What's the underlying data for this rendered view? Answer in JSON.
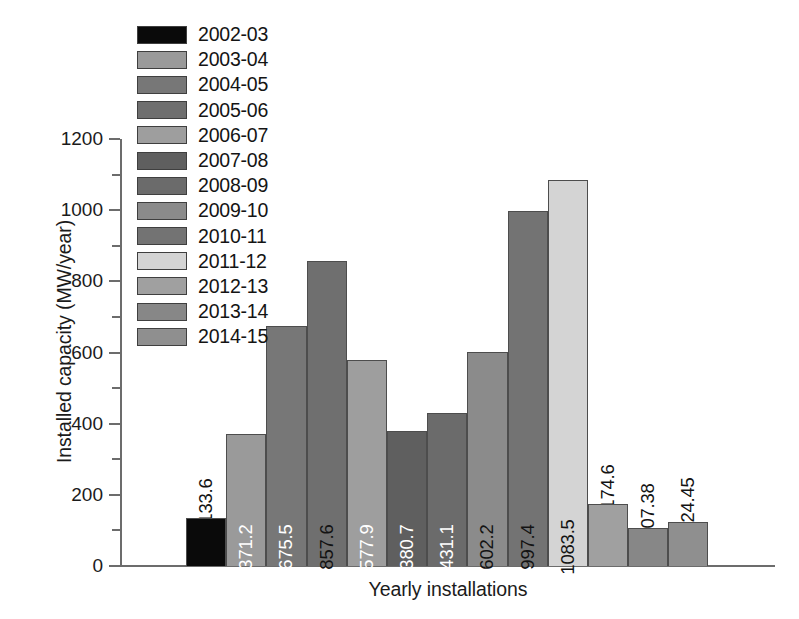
{
  "chart_data": {
    "type": "bar",
    "title": "",
    "xlabel": "Yearly installations",
    "ylabel": "Installed capacity (MW/year)",
    "ylim": [
      0,
      1200
    ],
    "ytick_labels": [
      "0",
      "200",
      "400",
      "600",
      "800",
      "1000",
      "1200"
    ],
    "ytick_values": [
      0,
      200,
      400,
      600,
      800,
      1000,
      1200
    ],
    "minor_tick_interval": 100,
    "grid": false,
    "legend_position": "top-left",
    "categories": [
      "2002-03",
      "2003-04",
      "2004-05",
      "2005-06",
      "2006-07",
      "2007-08",
      "2008-09",
      "2009-10",
      "2010-11",
      "2011-12",
      "2012-13",
      "2013-14",
      "2014-15"
    ],
    "values": [
      133.6,
      371.2,
      675.5,
      857.6,
      577.9,
      380.7,
      431.1,
      602.2,
      997.4,
      1083.5,
      174.6,
      107.38,
      124.45
    ],
    "value_labels": [
      "133.6",
      "371.2",
      "675.5",
      "857.6",
      "577.9",
      "380.7",
      "431.1",
      "602.2",
      "997.4",
      "1083.5",
      "174.6",
      "107.38",
      "124.45"
    ],
    "bar_colors": [
      "#0a0a0a",
      "#9a9a9a",
      "#777777",
      "#6f6f6f",
      "#9e9e9e",
      "#5f5f5f",
      "#6b6b6b",
      "#8b8b8b",
      "#737373",
      "#d4d4d4",
      "#a0a0a0",
      "#878787",
      "#8f8f8f"
    ],
    "label_text_colors": [
      "black",
      "white",
      "white",
      "black",
      "white",
      "white",
      "white",
      "black",
      "black",
      "black",
      "black",
      "black",
      "black"
    ],
    "label_placement": [
      "outside",
      "inside",
      "inside",
      "inside",
      "inside",
      "inside",
      "inside",
      "inside",
      "inside",
      "inside",
      "outside",
      "outside",
      "outside"
    ]
  },
  "legend": {
    "items": [
      {
        "label": "2002-03",
        "color": "#0a0a0a"
      },
      {
        "label": "2003-04",
        "color": "#9a9a9a"
      },
      {
        "label": "2004-05",
        "color": "#777777"
      },
      {
        "label": "2005-06",
        "color": "#6f6f6f"
      },
      {
        "label": "2006-07",
        "color": "#9e9e9e"
      },
      {
        "label": "2007-08",
        "color": "#5f5f5f"
      },
      {
        "label": "2008-09",
        "color": "#6b6b6b"
      },
      {
        "label": "2009-10",
        "color": "#8b8b8b"
      },
      {
        "label": "2010-11",
        "color": "#737373"
      },
      {
        "label": "2011-12",
        "color": "#d4d4d4"
      },
      {
        "label": "2012-13",
        "color": "#a0a0a0"
      },
      {
        "label": "2013-14",
        "color": "#878787"
      },
      {
        "label": "2014-15",
        "color": "#8f8f8f"
      }
    ]
  }
}
